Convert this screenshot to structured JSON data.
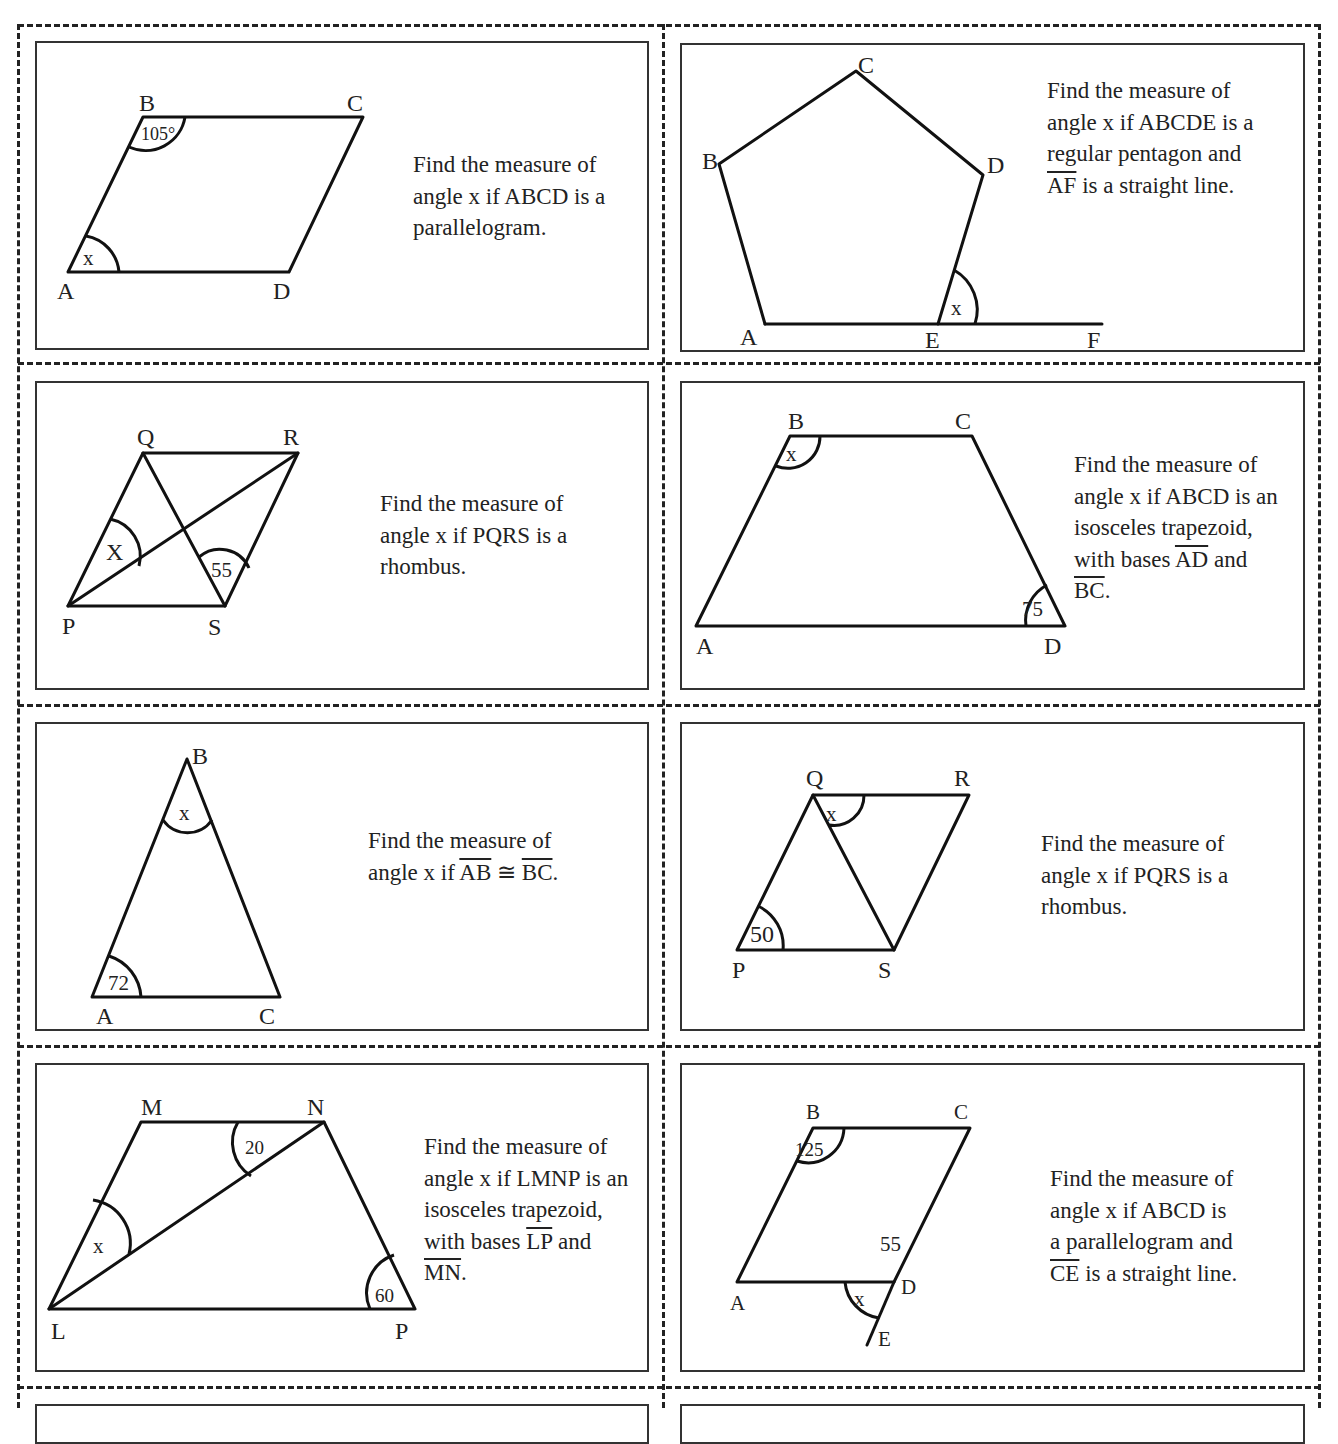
{
  "worksheet": {
    "cards": [
      {
        "id": 1,
        "prompt_lines": [
          "Find the measure of",
          "angle x if ABCD is a",
          "parallelogram."
        ],
        "vertices": {
          "A": "A",
          "B": "B",
          "C": "C",
          "D": "D"
        },
        "angle_labels": {
          "given": "105°",
          "unknown": "x"
        }
      },
      {
        "id": 2,
        "prompt_lines": [
          "Find the measure of",
          "angle x if ABCDE is a",
          "regular pentagon and",
          "AF",
          " is a straight line."
        ],
        "vertices": {
          "A": "A",
          "B": "B",
          "C": "C",
          "D": "D",
          "E": "E",
          "F": "F"
        },
        "angle_labels": {
          "unknown": "x"
        }
      },
      {
        "id": 3,
        "prompt_lines": [
          "Find the measure of",
          "angle x if PQRS is a",
          "rhombus."
        ],
        "vertices": {
          "P": "P",
          "Q": "Q",
          "R": "R",
          "S": "S"
        },
        "angle_labels": {
          "given": "55",
          "unknown": "X"
        }
      },
      {
        "id": 4,
        "prompt_lines": [
          "Find the measure of",
          "angle x if ABCD is an",
          "isosceles trapezoid,",
          "with bases ",
          "AD",
          " and",
          "BC",
          "."
        ],
        "vertices": {
          "A": "A",
          "B": "B",
          "C": "C",
          "D": "D"
        },
        "angle_labels": {
          "given": "75",
          "unknown": "x"
        }
      },
      {
        "id": 5,
        "prompt_lines": [
          "Find the measure of",
          "angle x if ",
          "AB",
          " ≅ ",
          "BC",
          "."
        ],
        "vertices": {
          "A": "A",
          "B": "B",
          "C": "C"
        },
        "angle_labels": {
          "given": "72",
          "unknown": "x"
        }
      },
      {
        "id": 6,
        "prompt_lines": [
          "Find the measure of",
          "angle x if PQRS is a",
          "rhombus."
        ],
        "vertices": {
          "P": "P",
          "Q": "Q",
          "R": "R",
          "S": "S"
        },
        "angle_labels": {
          "given": "50",
          "unknown": "x"
        }
      },
      {
        "id": 7,
        "prompt_lines": [
          "Find the measure of",
          "angle x if LMNP is an",
          "isosceles trapezoid,",
          "with bases ",
          "LP",
          " and",
          "MN",
          "."
        ],
        "vertices": {
          "L": "L",
          "M": "M",
          "N": "N",
          "P": "P"
        },
        "angle_labels": {
          "given_top": "20",
          "given_bottom": "60",
          "unknown": "x"
        }
      },
      {
        "id": 8,
        "prompt_lines": [
          "Find the measure of",
          "angle x if ABCD is",
          "a parallelogram and",
          "CE",
          " is a straight line."
        ],
        "vertices": {
          "A": "A",
          "B": "B",
          "C": "C",
          "D": "D",
          "E": "E"
        },
        "angle_labels": {
          "given_b": "125",
          "given_d": "55",
          "unknown": "x"
        }
      }
    ]
  }
}
